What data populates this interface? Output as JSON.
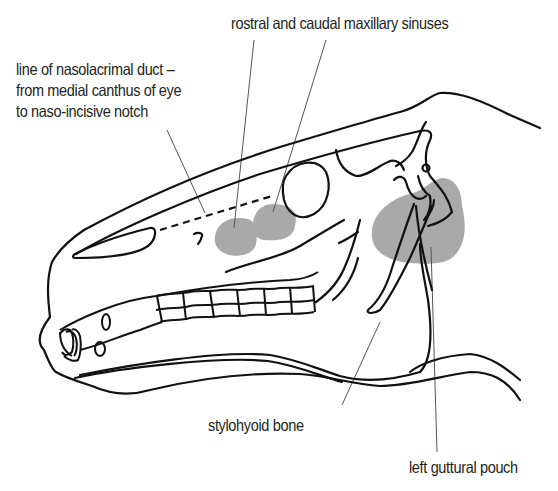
{
  "diagram": {
    "colors": {
      "outline": "#111111",
      "leader_line": "#555555",
      "shaded_region": "#a9a9a9",
      "text": "#231f20",
      "background": "#ffffff"
    },
    "labels": {
      "nasolacrimal": {
        "line1": "line of nasolacrimal duct –",
        "line2": "from medial canthus of eye",
        "line3": "to naso-incisive notch"
      },
      "sinuses": "rostral and caudal maxillary sinuses",
      "stylohyoid": "stylohyoid bone",
      "guttural_pouch": "left guttural pouch"
    },
    "structures": [
      {
        "name": "rostral maxillary sinus",
        "shaded": true
      },
      {
        "name": "caudal maxillary sinus",
        "shaded": true
      },
      {
        "name": "left guttural pouch",
        "shaded": true
      },
      {
        "name": "nasolacrimal duct line",
        "style": "dashed"
      },
      {
        "name": "orbit",
        "shaded": false
      },
      {
        "name": "stylohyoid bone",
        "shaded": false
      },
      {
        "name": "cheek teeth row",
        "shaded": false
      },
      {
        "name": "incisors",
        "shaded": false
      }
    ]
  }
}
